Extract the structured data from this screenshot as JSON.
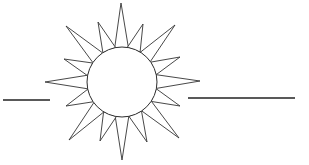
{
  "figure": {
    "stroke_color": "#333333",
    "background_color": "#ffffff",
    "sun": {
      "center": [
        122,
        82
      ],
      "radius": 35,
      "ray_count": 16,
      "ray_tips": [
        [
          121,
          3
        ],
        [
          143,
          24
        ],
        [
          175,
          25
        ],
        [
          180,
          57
        ],
        [
          200,
          81
        ],
        [
          180,
          106
        ],
        [
          179,
          138
        ],
        [
          147,
          142
        ],
        [
          122,
          160
        ],
        [
          100,
          141
        ],
        [
          69,
          140
        ],
        [
          66,
          106
        ],
        [
          45,
          82
        ],
        [
          64,
          59
        ],
        [
          66,
          26
        ],
        [
          98,
          22
        ]
      ]
    },
    "lines": [
      {
        "name": "left-horizon-line",
        "x1": 3,
        "y1": 100,
        "x2": 50,
        "y2": 100
      },
      {
        "name": "right-horizon-line",
        "x1": 188,
        "y1": 98,
        "x2": 295,
        "y2": 98
      }
    ]
  }
}
